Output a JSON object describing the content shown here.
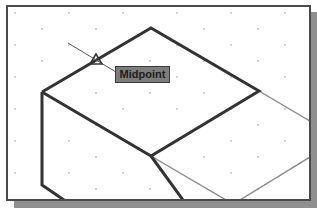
{
  "tooltip": {
    "label": "Midpoint"
  },
  "colors": {
    "canvas_bg": "#ffffff",
    "frame_border": "#4a4a4a",
    "shadow": "#8f8f8f",
    "thick_line": "#333333",
    "thin_line": "#888888",
    "grid_dot": "#999999",
    "tooltip_bg": "#7d7d7d"
  },
  "drawing": {
    "grid": {
      "type": "isometric",
      "spacing_x": 54,
      "spacing_y": 16,
      "row_offset": 27
    },
    "snap_marker": {
      "type": "midpoint-triangle",
      "x": 96,
      "y": 60
    }
  }
}
